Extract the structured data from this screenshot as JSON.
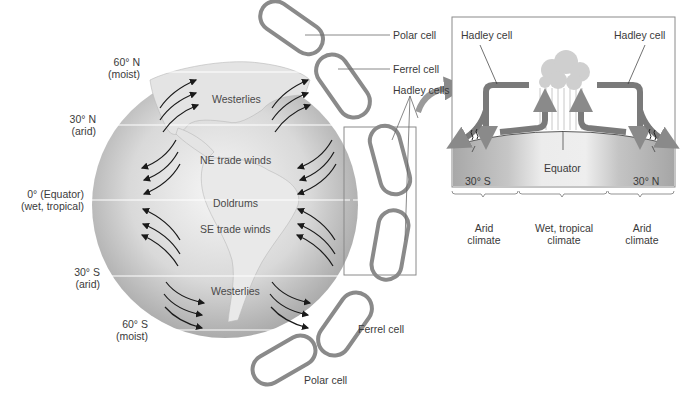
{
  "latitudes": [
    {
      "line1": "60° N",
      "line2": "(moist)"
    },
    {
      "line1": "30° N",
      "line2": "(arid)"
    },
    {
      "line1": "0° (Equator)",
      "line2": "(wet, tropical)"
    },
    {
      "line1": "30° S",
      "line2": "(arid)"
    },
    {
      "line1": "60° S",
      "line2": "(moist)"
    }
  ],
  "wind_belts": {
    "westerlies_north": "Westerlies",
    "ne_trade_winds": "NE trade winds",
    "doldrums": "Doldrums",
    "se_trade_winds": "SE trade winds",
    "westerlies_south": "Westerlies"
  },
  "cell_labels": {
    "polar_north": "Polar cell",
    "ferrel_north": "Ferrel cell",
    "hadley_cells": "Hadley cells",
    "ferrel_south": "Ferrel cell",
    "polar_south": "Polar cell"
  },
  "inset": {
    "hadley_left": "Hadley cell",
    "hadley_right": "Hadley cell",
    "equator": "Equator",
    "lat_south": "30° S",
    "lat_north": "30° N",
    "climates": [
      {
        "line1": "Arid",
        "line2": "climate"
      },
      {
        "line1": "Wet, tropical",
        "line2": "climate"
      },
      {
        "line1": "Arid",
        "line2": "climate"
      }
    ]
  },
  "colors": {
    "cell_arrow": "#8a8a8a",
    "wind_arrow": "#1a1a1a",
    "globe_light": "#f2f2f2",
    "globe_dark": "#9a9a9a"
  }
}
